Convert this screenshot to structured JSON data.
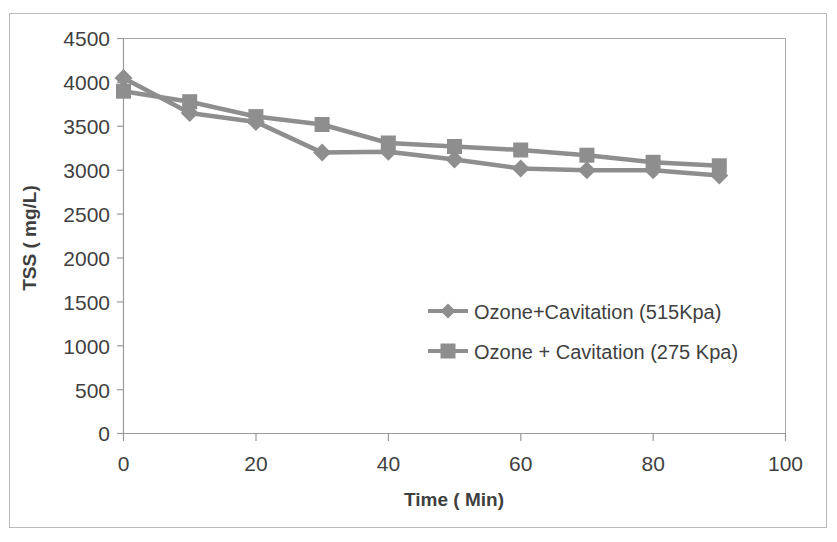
{
  "chart_data": {
    "type": "line",
    "title": "",
    "subtitle": "",
    "xlabel": "Time ( Min)",
    "ylabel": "TSS ( mg/L)",
    "x": [
      0,
      10,
      20,
      30,
      40,
      50,
      60,
      70,
      80,
      90
    ],
    "xlim": [
      0,
      100
    ],
    "ylim": [
      0,
      4500
    ],
    "xticks": [
      "0",
      "20",
      "40",
      "60",
      "80",
      "100"
    ],
    "xtick_values": [
      0,
      20,
      40,
      60,
      80,
      100
    ],
    "yticks": [
      "0",
      "500",
      "1000",
      "1500",
      "2000",
      "2500",
      "3000",
      "3500",
      "4000",
      "4500"
    ],
    "ytick_values": [
      0,
      500,
      1000,
      1500,
      2000,
      2500,
      3000,
      3500,
      4000,
      4500
    ],
    "grid": false,
    "legend_position": "center",
    "series": [
      {
        "name": "Ozone+Cavitation (515Kpa)",
        "marker": "diamond",
        "color": "#8e8e8e",
        "values": [
          4050,
          3650,
          3550,
          3200,
          3210,
          3120,
          3020,
          3000,
          3000,
          2940
        ]
      },
      {
        "name": "Ozone + Cavitation (275 Kpa)",
        "marker": "square",
        "color": "#8e8e8e",
        "values": [
          3900,
          3780,
          3610,
          3520,
          3310,
          3270,
          3230,
          3170,
          3090,
          3050
        ]
      }
    ]
  },
  "figure": {
    "plot_frame_color": "#a9a9a9",
    "outer_frame_color": "#b9b9b9",
    "background": "#ffffff",
    "text_color": "#3f3f3f"
  }
}
